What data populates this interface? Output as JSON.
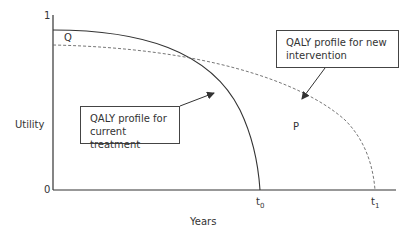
{
  "axes": {
    "y_label": "Utility",
    "x_label": "Years",
    "y_top_tick": "1",
    "y_bottom_tick": "0",
    "x_ticks": [
      {
        "base": "t",
        "sub": "0"
      },
      {
        "base": "t",
        "sub": "1"
      }
    ]
  },
  "regions": {
    "q_label": "Q",
    "p_label": "P"
  },
  "callouts": {
    "new_intervention": {
      "line1": "QALY profile for new",
      "line2": "intervention"
    },
    "current_treatment": {
      "line1": "QALY profile for",
      "line2": "current treatment"
    }
  },
  "curves": [
    {
      "name": "Current treatment",
      "style": "solid",
      "color": "#333333"
    },
    {
      "name": "New intervention",
      "style": "dashed",
      "color": "#555555"
    }
  ]
}
